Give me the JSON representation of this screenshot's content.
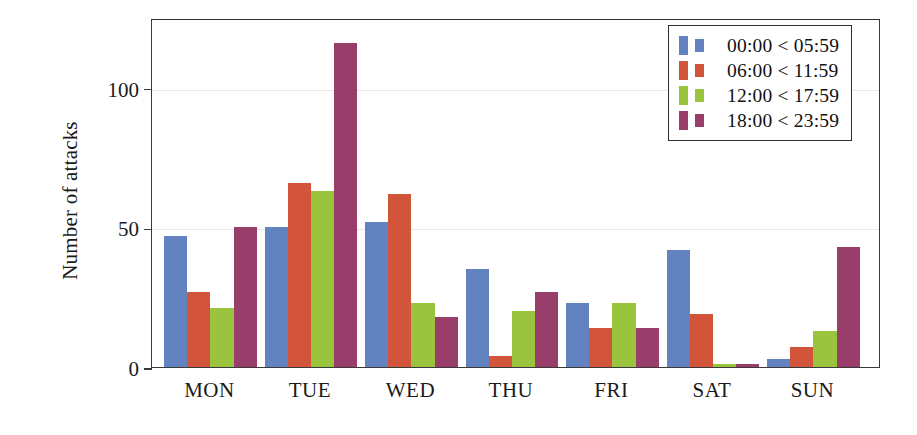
{
  "chart_data": {
    "type": "bar",
    "title": "",
    "xlabel": "",
    "ylabel": "Number of attacks",
    "ylim": [
      0,
      125
    ],
    "yticks": [
      0,
      50,
      100
    ],
    "ytick_labels": [
      "0",
      "50",
      "100"
    ],
    "grid": true,
    "legend_position": "top-right",
    "categories": [
      "MON",
      "TUE",
      "WED",
      "THU",
      "FRI",
      "SAT",
      "SUN"
    ],
    "series": [
      {
        "name": "00:00 < 05:59",
        "color": "#6383c0",
        "values": [
          47,
          50,
          52,
          35,
          23,
          42,
          3
        ]
      },
      {
        "name": "06:00 < 11:59",
        "color": "#d2543a",
        "values": [
          27,
          66,
          62,
          4,
          14,
          19,
          7
        ]
      },
      {
        "name": "12:00 < 17:59",
        "color": "#9ac43e",
        "values": [
          21,
          63,
          23,
          20,
          23,
          1,
          13
        ]
      },
      {
        "name": "18:00 < 23:59",
        "color": "#993d6b",
        "values": [
          50,
          116,
          18,
          27,
          14,
          1,
          43
        ]
      }
    ]
  },
  "axis": {
    "y_title": "Number of attacks"
  },
  "legend": {
    "entries": [
      {
        "label": "00:00 < 05:59",
        "color": "#6383c0"
      },
      {
        "label": "06:00 < 11:59",
        "color": "#d2543a"
      },
      {
        "label": "12:00 < 17:59",
        "color": "#9ac43e"
      },
      {
        "label": "18:00 < 23:59",
        "color": "#993d6b"
      }
    ]
  }
}
